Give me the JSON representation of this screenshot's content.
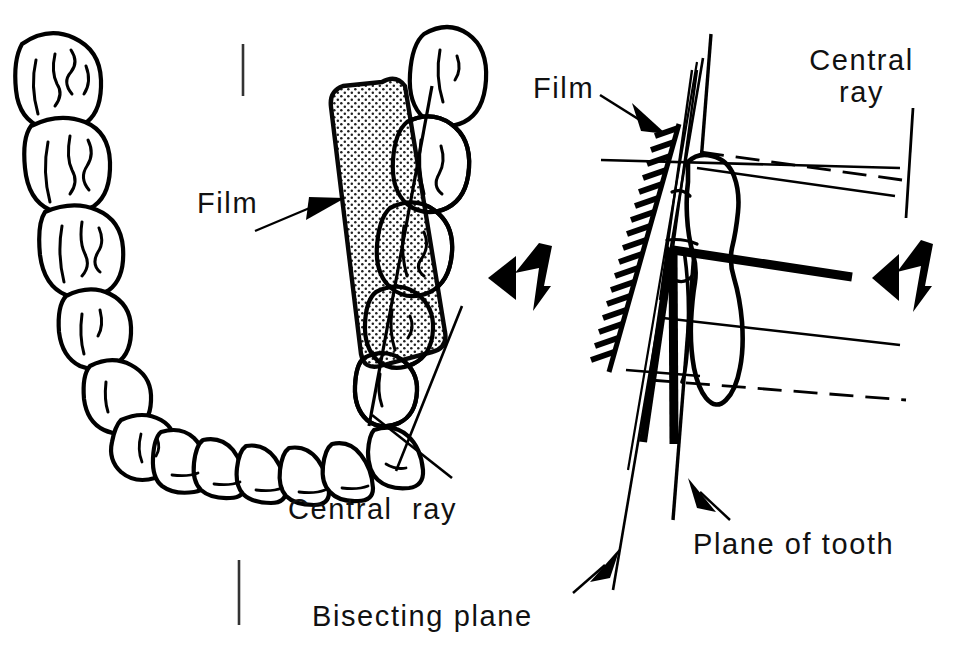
{
  "figure": {
    "width": 976,
    "height": 649,
    "background_color": "#ffffff",
    "ink_color": "#000000"
  },
  "labels": {
    "film_left": "Film",
    "film_right": "Film",
    "central_ray_top": "Central\nray",
    "central_ray_bottom": "Central  ray",
    "bisecting_plane": "Bisecting plane",
    "plane_of_tooth": "Plane of tooth"
  },
  "panels": {
    "left": {
      "name": "occlusal-arch-view",
      "description": "Occlusal view of mandibular dental arch with stippled intraoral film placed over the right posterior quadrant",
      "tooth_count": 16,
      "film_fill": "stippled",
      "film_label": "Film",
      "central_ray_label": "Central  ray"
    },
    "right": {
      "name": "tooth-cross-section-view",
      "description": "Sagittal cross-section of a single tooth with film, bisecting plane, plane of tooth and central ray",
      "film_label": "Film",
      "central_ray_label": "Central\nray",
      "bisecting_plane_label": "Bisecting plane",
      "plane_of_tooth_label": "Plane of tooth"
    }
  },
  "markers": {
    "beam_arrow_count": 2,
    "beam_arrow_direction": "left",
    "tick_marks": 3
  }
}
